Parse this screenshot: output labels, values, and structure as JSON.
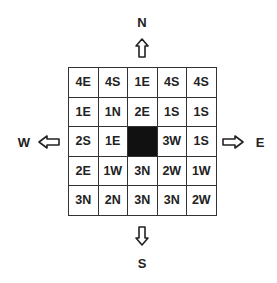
{
  "compass": {
    "north": "N",
    "south": "S",
    "east": "E",
    "west": "W"
  },
  "grid": {
    "rows": [
      [
        "4E",
        "4S",
        "1E",
        "4S",
        "4S"
      ],
      [
        "1E",
        "1N",
        "2E",
        "1S",
        "1S"
      ],
      [
        "2S",
        "1E",
        "",
        "3W",
        "1S"
      ],
      [
        "2E",
        "1W",
        "3N",
        "2W",
        "1W"
      ],
      [
        "3N",
        "2N",
        "3N",
        "3N",
        "2W"
      ]
    ],
    "blank_cell": {
      "row": 2,
      "col": 2,
      "color": "#111111"
    }
  }
}
